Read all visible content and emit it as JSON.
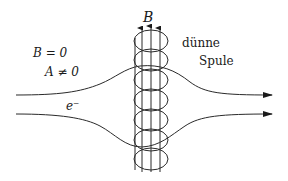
{
  "figure": {
    "type": "aharonov-bohm-thin-solenoid",
    "labels": {
      "field_label": "B",
      "outside_field": "B = 0",
      "outside_potential": "A ≠ 0",
      "coil_line1": "dünne",
      "coil_line2": "Spule",
      "particle": "e⁻"
    },
    "colors": {
      "ink": "#2a2a2a",
      "background": "#ffffff"
    },
    "coil": {
      "center_x": 151,
      "loops": 7,
      "field_arrows": 3
    },
    "trajectories": [
      {
        "name": "upper-electron-path",
        "start_y": 95,
        "end_y": 95,
        "direction": "right"
      },
      {
        "name": "lower-electron-path",
        "start_y": 114,
        "end_y": 114,
        "direction": "right"
      }
    ]
  }
}
